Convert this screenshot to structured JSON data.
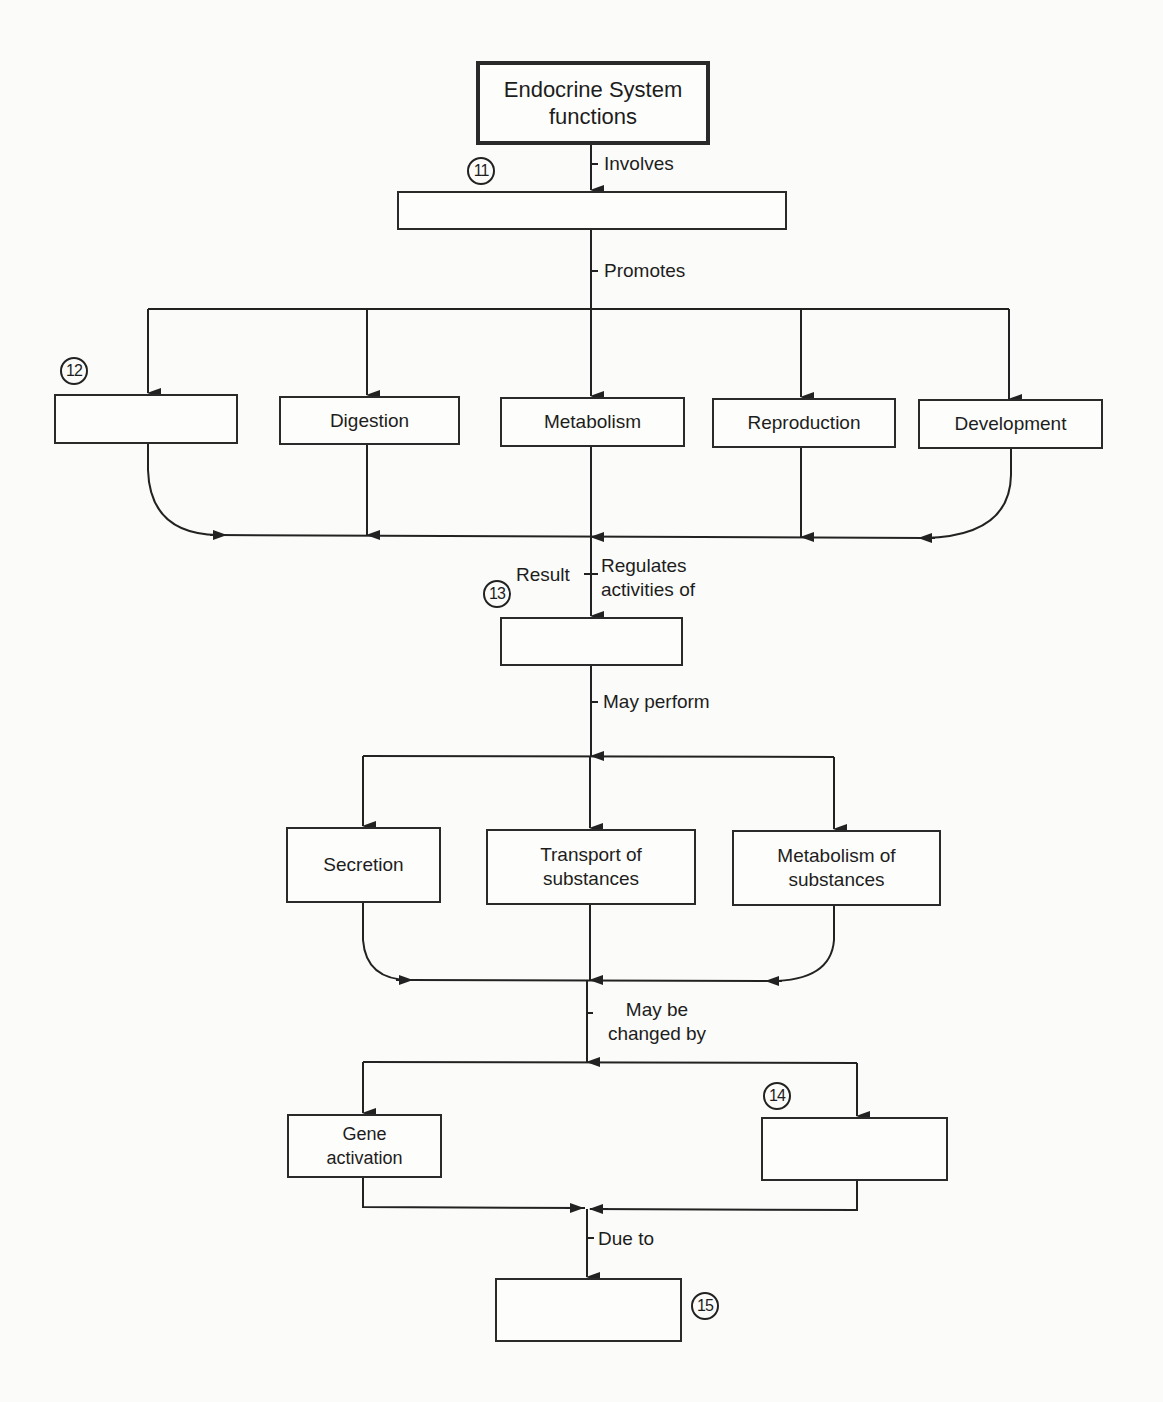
{
  "diagram": {
    "title_box": "Endocrine System functions",
    "links": {
      "involves": "Involves",
      "promotes": "Promotes",
      "result": "Result",
      "regulates": "Regulates activities of",
      "may_perform": "May perform",
      "may_be_changed_by": "May be changed by",
      "due_to": "Due to"
    },
    "blank_box_11": "",
    "promotes_boxes": [
      "",
      "Digestion",
      "Metabolism",
      "Reproduction",
      "Development"
    ],
    "blank_box_13": "",
    "perform_boxes": [
      "Secretion",
      "Transport of substances",
      "Metabolism of substances"
    ],
    "change_boxes": [
      "Gene activation",
      ""
    ],
    "blank_box_15": "",
    "markers": [
      "11",
      "12",
      "13",
      "14",
      "15"
    ]
  }
}
